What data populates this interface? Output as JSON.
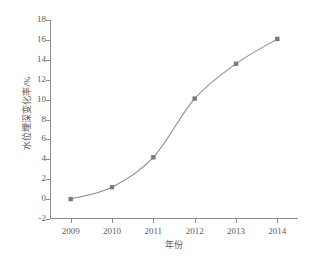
{
  "chart_data": {
    "type": "line",
    "title": "",
    "xlabel": "年份",
    "ylabel": "水位埋深变化率/%",
    "categories": [
      "2009",
      "2010",
      "2011",
      "2012",
      "2013",
      "2014"
    ],
    "x": [
      2009,
      2010,
      2011,
      2012,
      2013,
      2014
    ],
    "values": [
      0.0,
      1.2,
      4.2,
      10.1,
      13.6,
      16.1
    ],
    "series": [
      {
        "name": "水位埋深变化率",
        "values": [
          0.0,
          1.2,
          4.2,
          10.1,
          13.6,
          16.1
        ],
        "marker": "square",
        "color": "#7a7a7a",
        "line_color": "#8d8d8d"
      }
    ],
    "ylim": [
      -2,
      18
    ],
    "xlim": [
      2008.5,
      2014.5
    ],
    "yticks": [
      -2,
      0,
      2,
      4,
      6,
      8,
      10,
      12,
      14,
      16,
      18
    ],
    "ytick_labels": [
      "-2",
      "0",
      "2",
      "4",
      "6",
      "8",
      "10",
      "12",
      "14",
      "16",
      "18"
    ],
    "xticks": [
      2009,
      2010,
      2011,
      2012,
      2013,
      2014
    ],
    "xtick_labels": [
      "2009",
      "2010",
      "2011",
      "2012",
      "2013",
      "2014"
    ],
    "grid": false,
    "legend": null,
    "legend_position": "none",
    "annotations": []
  },
  "figure": {
    "background_color": "#ffffff",
    "axis_color": "#8d8d8d",
    "text_color": "#5a5a5a",
    "accent_color": "#7a7a7a"
  }
}
